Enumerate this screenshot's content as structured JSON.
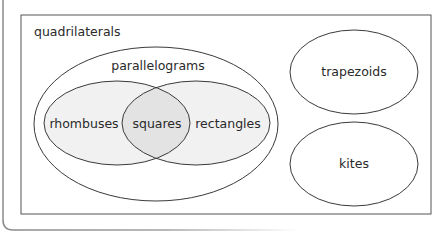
{
  "diagram": {
    "type": "venn",
    "outer_label": "quadrilaterals",
    "sets": [
      {
        "id": "parallelograms",
        "label": "parallelograms"
      },
      {
        "id": "rhombuses",
        "label": "rhombuses"
      },
      {
        "id": "rectangles",
        "label": "rectangles"
      },
      {
        "id": "squares",
        "label": "squares"
      },
      {
        "id": "trapezoids",
        "label": "trapezoids"
      },
      {
        "id": "kites",
        "label": "kites"
      }
    ],
    "relations": [
      "rhombuses ⊂ parallelograms",
      "rectangles ⊂ parallelograms",
      "squares = rhombuses ∩ rectangles",
      "trapezoids, kites, parallelograms ⊂ quadrilaterals"
    ],
    "colors": {
      "stroke": "#3a3a3a",
      "set_fill": "#f1f1f1",
      "intersection_fill": "#e3e3e3",
      "frame": "#8a8a8a"
    }
  }
}
